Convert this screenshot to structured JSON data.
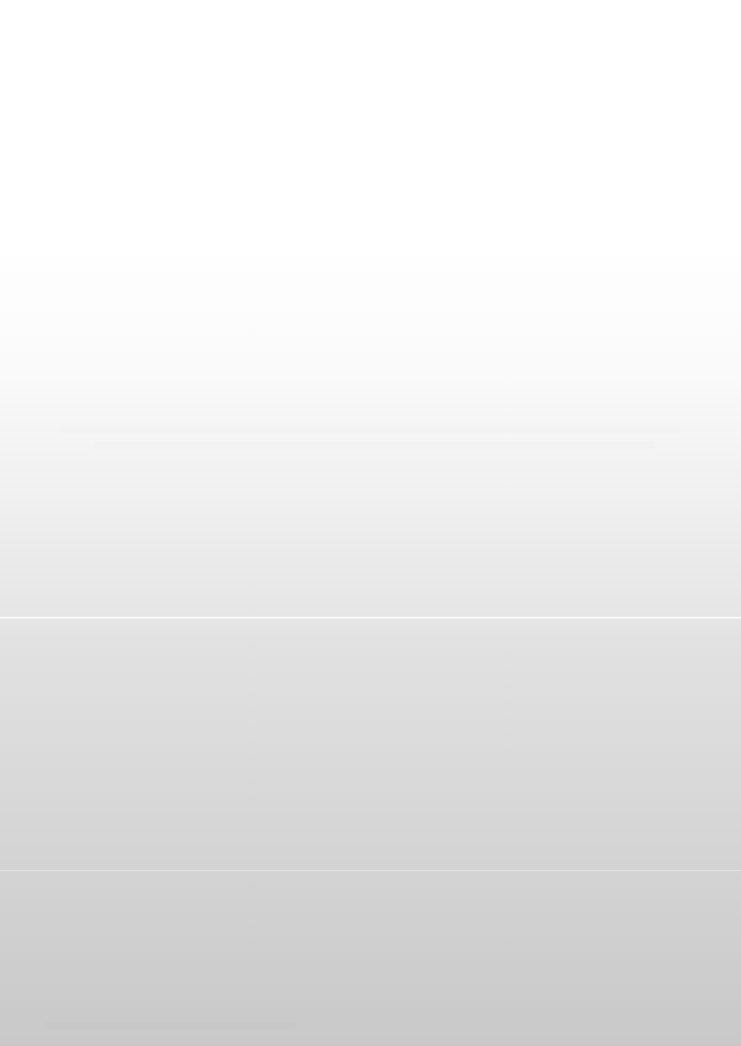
{
  "capture": {
    "width": 741,
    "height": 1046,
    "content_state": "blank",
    "legible_text": false,
    "description": "Blank page surface with a vertical white-to-gray gradient and a single light horizontal separator rule. No text, icons, controls, or window chrome are rendered in the captured pixels."
  },
  "surface": {
    "base_color": "#ffffff",
    "darkest_color": "#c9c9c9",
    "gradient_direction": "top-to-bottom",
    "gradient_stops": [
      {
        "y": 0,
        "color": "#ffffff"
      },
      {
        "y": 250,
        "color": "#ffffff"
      },
      {
        "y": 380,
        "color": "#fafafa"
      },
      {
        "y": 500,
        "color": "#f0f0f0"
      },
      {
        "y": 617,
        "color": "#e6e6e6"
      },
      {
        "y": 640,
        "color": "#e2e2e2"
      },
      {
        "y": 800,
        "color": "#d8d8d8"
      },
      {
        "y": 1046,
        "color": "#c9c9c9"
      }
    ]
  },
  "separators": [
    {
      "id": "primary",
      "y": 617,
      "x": 0,
      "width": 741,
      "thickness": 1,
      "color": "#ffffff",
      "tone": "lighter-than-background",
      "prominence": "distinct"
    },
    {
      "id": "secondary",
      "y": 870,
      "x": 0,
      "width": 741,
      "thickness": 1,
      "color": "#ffffff",
      "tone": "lighter-than-background",
      "prominence": "very-faint"
    }
  ],
  "residue_bands": [
    {
      "id": "upper",
      "x": 60,
      "y": 424,
      "width": 620,
      "height": 9
    },
    {
      "id": "upper-second",
      "x": 95,
      "y": 441,
      "width": 560,
      "height": 8
    },
    {
      "id": "lower",
      "x": 45,
      "y": 1022,
      "width": 250,
      "height": 7
    }
  ]
}
